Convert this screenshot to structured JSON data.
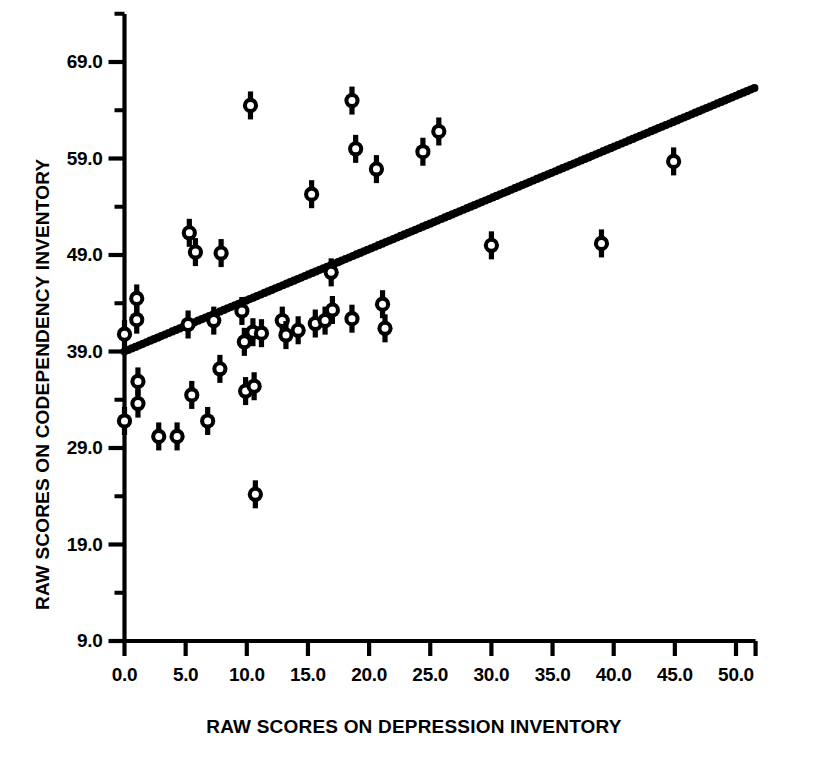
{
  "chart_data": {
    "type": "scatter",
    "title": "",
    "xlabel": "RAW SCORES ON DEPRESSION INVENTORY",
    "ylabel": "RAW SCORES ON CODEPENDENCY INVENTORY",
    "xlim": [
      -1.0,
      53.0
    ],
    "ylim": [
      6.0,
      71.5
    ],
    "xticks": [
      0.0,
      5.0,
      10.0,
      15.0,
      20.0,
      25.0,
      30.0,
      35.0,
      40.0,
      45.0,
      50.0
    ],
    "xtick_labels": [
      "0.0",
      "5.0",
      "10.0",
      "15.0",
      "20.0",
      "25.0",
      "30.0",
      "35.0",
      "40.0",
      "45.0",
      "50.0"
    ],
    "yticks": [
      9.0,
      19.0,
      29.0,
      39.0,
      49.0,
      59.0,
      69.0
    ],
    "ytick_labels": [
      "9.0",
      "19.0",
      "29.0",
      "39.0",
      "49.0",
      "59.0",
      "69.0"
    ],
    "y_minor_ticks": [
      14.0,
      24.0,
      34.0,
      44.0,
      54.0,
      64.0
    ],
    "grid": false,
    "legend": null,
    "marker_style": "open-circle-with-vertical-whiskers",
    "marker_color": "#000000",
    "line_color": "#000000",
    "axis_color": "#000000",
    "background_color": "#ffffff",
    "points": [
      {
        "x": 0.0,
        "y": 40.8
      },
      {
        "x": 0.0,
        "y": 31.8
      },
      {
        "x": 1.0,
        "y": 44.5
      },
      {
        "x": 1.0,
        "y": 42.3
      },
      {
        "x": 1.1,
        "y": 35.9
      },
      {
        "x": 1.1,
        "y": 33.6
      },
      {
        "x": 2.8,
        "y": 30.2
      },
      {
        "x": 4.3,
        "y": 30.2
      },
      {
        "x": 5.2,
        "y": 41.8
      },
      {
        "x": 5.3,
        "y": 51.3
      },
      {
        "x": 5.5,
        "y": 34.5
      },
      {
        "x": 5.8,
        "y": 49.3
      },
      {
        "x": 6.8,
        "y": 31.8
      },
      {
        "x": 7.3,
        "y": 42.2
      },
      {
        "x": 7.9,
        "y": 49.2
      },
      {
        "x": 7.8,
        "y": 37.2
      },
      {
        "x": 9.6,
        "y": 43.2
      },
      {
        "x": 9.8,
        "y": 40.0
      },
      {
        "x": 9.9,
        "y": 34.9
      },
      {
        "x": 10.3,
        "y": 64.5
      },
      {
        "x": 10.5,
        "y": 41.0
      },
      {
        "x": 10.6,
        "y": 35.4
      },
      {
        "x": 10.7,
        "y": 24.2
      },
      {
        "x": 11.2,
        "y": 40.9
      },
      {
        "x": 12.9,
        "y": 42.2
      },
      {
        "x": 13.2,
        "y": 40.7
      },
      {
        "x": 14.2,
        "y": 41.2
      },
      {
        "x": 15.3,
        "y": 55.3
      },
      {
        "x": 15.6,
        "y": 41.9
      },
      {
        "x": 16.4,
        "y": 42.2
      },
      {
        "x": 16.9,
        "y": 47.2
      },
      {
        "x": 17.0,
        "y": 43.3
      },
      {
        "x": 18.6,
        "y": 65.0
      },
      {
        "x": 18.9,
        "y": 60.0
      },
      {
        "x": 18.6,
        "y": 42.4
      },
      {
        "x": 20.6,
        "y": 57.9
      },
      {
        "x": 21.1,
        "y": 43.9
      },
      {
        "x": 21.3,
        "y": 41.4
      },
      {
        "x": 24.4,
        "y": 59.7
      },
      {
        "x": 25.7,
        "y": 61.8
      },
      {
        "x": 30.0,
        "y": 50.0
      },
      {
        "x": 39.0,
        "y": 50.2
      },
      {
        "x": 44.9,
        "y": 58.7
      }
    ],
    "regression_line": {
      "x_start": 0.0,
      "y_start": 39.0,
      "x_end": 51.5,
      "y_end": 66.3,
      "style": "thick-dotted",
      "slope": 0.53,
      "intercept": 39.0
    }
  }
}
